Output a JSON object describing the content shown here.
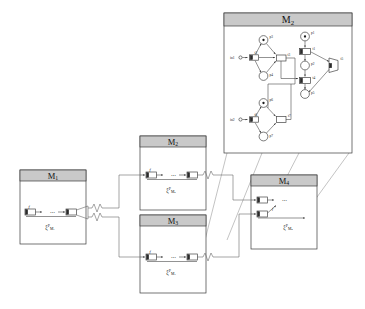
{
  "figure": {
    "kind": "hierarchical-petri-net-diagram"
  },
  "expanded_module": {
    "title_base": "M",
    "title_sub": "2",
    "inputs": [
      {
        "id": "in1",
        "label": "in1"
      },
      {
        "id": "in2",
        "label": "in2"
      }
    ],
    "places": [
      {
        "id": "p1",
        "label": "p1",
        "tokens": 1
      },
      {
        "id": "p2",
        "label": "p2",
        "tokens": 0
      },
      {
        "id": "p3",
        "label": "p3",
        "tokens": 1
      },
      {
        "id": "p4",
        "label": "p4",
        "tokens": 0
      },
      {
        "id": "p5",
        "label": "p5",
        "tokens": 0
      },
      {
        "id": "p6",
        "label": "p6",
        "tokens": 1
      },
      {
        "id": "p7",
        "label": "p7",
        "tokens": 0
      }
    ],
    "transitions": [
      {
        "id": "t1",
        "label": "t1"
      },
      {
        "id": "t2",
        "label": "t2"
      },
      {
        "id": "t3",
        "label": "t3"
      },
      {
        "id": "t4",
        "label": "t4"
      },
      {
        "id": "t5",
        "label": "t5"
      },
      {
        "id": "t6",
        "label": "t6"
      },
      {
        "id": "t7",
        "label": "t7"
      }
    ]
  },
  "modules": [
    {
      "id": "M1",
      "title_base": "M",
      "title_sub": "1",
      "xi_base": "ξ",
      "xi_sup": "P",
      "xi_sub_base": "M",
      "xi_sub_index": "1",
      "f_label": "f"
    },
    {
      "id": "M2",
      "title_base": "M",
      "title_sub": "2",
      "xi_base": "ξ",
      "xi_sup": "P",
      "xi_sub_base": "M",
      "xi_sub_index": "2",
      "f_label": "f"
    },
    {
      "id": "M3",
      "title_base": "M",
      "title_sub": "3",
      "xi_base": "ξ",
      "xi_sup": "P",
      "xi_sub_base": "M",
      "xi_sub_index": "3",
      "f_label": "f"
    },
    {
      "id": "M4",
      "title_base": "M",
      "title_sub": "4",
      "xi_base": "ξ",
      "xi_sup": "P",
      "xi_sub_base": "M",
      "xi_sub_index": "4",
      "f_label": "f"
    }
  ],
  "ellipsis": "⋯",
  "colors": {
    "header_fill": "#c9c9c9",
    "box_stroke": "#3a3a3a",
    "arc_stroke": "#4a4a4a",
    "link_stroke": "#6a6a6a",
    "cone_stroke": "#9a9a9a",
    "token_fill": "#1a1a1a",
    "background": "#ffffff"
  }
}
